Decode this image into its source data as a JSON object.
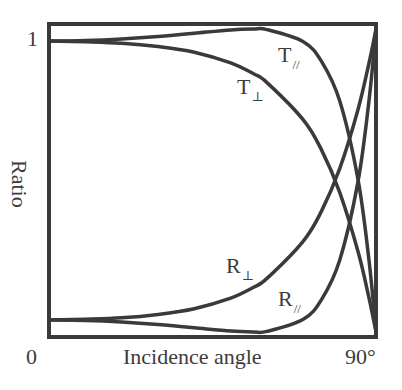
{
  "chart_data": {
    "type": "line",
    "title": "",
    "xlabel": "Incidence angle",
    "ylabel": "Ratio",
    "x_tick_labels": [
      "0",
      "90°"
    ],
    "y_tick_labels": [
      "1"
    ],
    "xlim": [
      0,
      90
    ],
    "ylim": [
      0,
      1
    ],
    "grid": false,
    "legend": "inline labels",
    "x": [
      0,
      10,
      20,
      30,
      40,
      50,
      56.3,
      60,
      70,
      75,
      80,
      85,
      88,
      90
    ],
    "series": [
      {
        "name": "T∥",
        "label_main": "T",
        "label_sub": "//",
        "values": [
          0.96,
          0.962,
          0.967,
          0.975,
          0.986,
          0.997,
          1.0,
          0.998,
          0.958,
          0.893,
          0.763,
          0.507,
          0.245,
          0.0
        ]
      },
      {
        "name": "T⊥",
        "label_main": "T",
        "label_sub": "⊥",
        "values": [
          0.96,
          0.958,
          0.953,
          0.942,
          0.923,
          0.888,
          0.852,
          0.823,
          0.7,
          0.601,
          0.461,
          0.268,
          0.117,
          0.0
        ]
      },
      {
        "name": "R⊥",
        "label_main": "R",
        "label_sub": "⊥",
        "values": [
          0.04,
          0.042,
          0.047,
          0.058,
          0.077,
          0.112,
          0.148,
          0.177,
          0.3,
          0.399,
          0.539,
          0.732,
          0.883,
          1.0
        ]
      },
      {
        "name": "R∥",
        "label_main": "R",
        "label_sub": "//",
        "values": [
          0.04,
          0.038,
          0.033,
          0.025,
          0.014,
          0.003,
          0.0,
          0.002,
          0.042,
          0.107,
          0.237,
          0.493,
          0.755,
          1.0
        ]
      }
    ]
  },
  "axes": {
    "xlabel": "Incidence angle",
    "ylabel": "Ratio",
    "x_min_label": "0",
    "x_max_label": "90°",
    "y_max_label": "1"
  },
  "labels": {
    "t_par": {
      "main": "T",
      "sub": "//"
    },
    "t_perp": {
      "main": "T",
      "sub": "⊥"
    },
    "r_perp": {
      "main": "R",
      "sub": "⊥"
    },
    "r_par": {
      "main": "R",
      "sub": "//"
    }
  },
  "colors": {
    "line": "#3a3a3a",
    "background": "#ffffff"
  }
}
